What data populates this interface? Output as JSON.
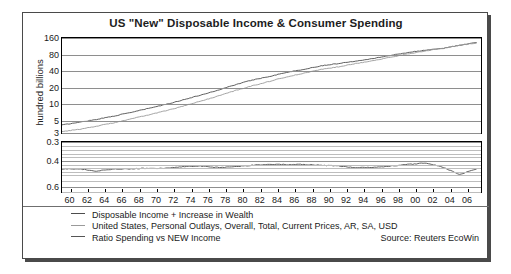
{
  "chart_data": {
    "type": "line",
    "title": "US \"New\" Disposable Income & Consumer Spending",
    "ylabel": "hundred billions",
    "xlabel": "",
    "source": "Source: Reuters EcoWin",
    "panels": [
      {
        "name": "levels",
        "scale": "log",
        "yticks": [
          160,
          80,
          40,
          20,
          10,
          5,
          3
        ],
        "ylim": [
          3,
          160
        ],
        "series": [
          {
            "name": "Disposable Income + Increase in Wealth",
            "color": "#4d4d4d",
            "x": [
              1959,
              1961,
              1963,
              1965,
              1967,
              1969,
              1971,
              1973,
              1975,
              1977,
              1979,
              1981,
              1983,
              1985,
              1987,
              1989,
              1991,
              1993,
              1995,
              1997,
              1999,
              2001,
              2003,
              2005,
              2007
            ],
            "values": [
              4.2,
              4.7,
              5.3,
              6.1,
              7.1,
              8.4,
              9.9,
              12.0,
              14.6,
              17.9,
              22.5,
              27.5,
              32.0,
              38.0,
              43.0,
              50.0,
              55.0,
              61.0,
              68.0,
              77.0,
              87.0,
              96.0,
              103.0,
              118.0,
              132.0
            ]
          },
          {
            "name": "United States, Personal Outlays, Overall, Total, Current Prices, AR, SA, USD",
            "color": "#9a9a9a",
            "x": [
              1959,
              1961,
              1963,
              1965,
              1967,
              1969,
              1971,
              1973,
              1975,
              1977,
              1979,
              1981,
              1983,
              1985,
              1987,
              1989,
              1991,
              1993,
              1995,
              1997,
              1999,
              2001,
              2003,
              2005,
              2007
            ],
            "values": [
              3.2,
              3.5,
              4.0,
              4.6,
              5.4,
              6.4,
              7.6,
              9.2,
              11.3,
              14.0,
              17.6,
              21.6,
              26.0,
              31.5,
              36.5,
              43.0,
              48.0,
              55.0,
              62.0,
              71.0,
              82.0,
              93.0,
              103.0,
              118.0,
              130.0
            ]
          }
        ]
      },
      {
        "name": "ratio",
        "scale": "log-inverted",
        "yticks": [
          0.3,
          0.4,
          0.6
        ],
        "ylim": [
          0.3,
          0.65
        ],
        "series": [
          {
            "name": "Ratio Spending vs NEW Income",
            "color": "#4d4d4d",
            "x": [
              1959,
              1961,
              1963,
              1965,
              1967,
              1969,
              1971,
              1973,
              1975,
              1977,
              1979,
              1981,
              1983,
              1985,
              1987,
              1989,
              1991,
              1993,
              1995,
              1997,
              1999,
              2001,
              2003,
              2005,
              2007
            ],
            "values": [
              0.455,
              0.455,
              0.47,
              0.455,
              0.455,
              0.45,
              0.45,
              0.44,
              0.435,
              0.445,
              0.44,
              0.43,
              0.425,
              0.425,
              0.425,
              0.43,
              0.435,
              0.445,
              0.445,
              0.435,
              0.425,
              0.415,
              0.44,
              0.495,
              0.455
            ]
          }
        ]
      }
    ],
    "xticks": [
      "60",
      "62",
      "64",
      "66",
      "68",
      "70",
      "72",
      "74",
      "76",
      "78",
      "80",
      "82",
      "84",
      "86",
      "88",
      "90",
      "92",
      "94",
      "96",
      "98",
      "00",
      "02",
      "04",
      "06"
    ],
    "legend": [
      {
        "label": "Disposable Income + Increase in Wealth",
        "color": "#4d4d4d"
      },
      {
        "label": "United States, Personal Outlays, Overall, Total, Current Prices, AR, SA, USD",
        "color": "#9a9a9a"
      },
      {
        "label": "Ratio Spending vs NEW Income",
        "color": "#555555"
      }
    ]
  }
}
